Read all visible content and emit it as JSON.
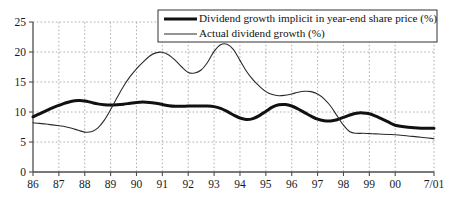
{
  "chart_data": {
    "type": "line",
    "title": "",
    "xlabel": "",
    "ylabel": "",
    "xlim": [
      1986,
      2001.5
    ],
    "ylim": [
      0,
      25
    ],
    "yticks": [
      0,
      5,
      10,
      15,
      20,
      25
    ],
    "ytick_labels": [
      "0",
      "5",
      "10",
      "15",
      "20",
      "25"
    ],
    "xtick_labels": [
      "86",
      "87",
      "88",
      "89",
      "90",
      "91",
      "92",
      "93",
      "94",
      "95",
      "96",
      "97",
      "98",
      "99",
      "00",
      "7/01"
    ],
    "xtick_values": [
      1986,
      1987,
      1988,
      1989,
      1990,
      1991,
      1992,
      1993,
      1994,
      1995,
      1996,
      1997,
      1998,
      1999,
      2000,
      2001.5
    ],
    "grid": true,
    "grid_style": "dotted",
    "legend_position": "top-right",
    "series": [
      {
        "name": "Dividend growth implicit in year-end share price (%)",
        "color": "#111111",
        "width": 3.0,
        "x": [
          1986.0,
          1986.25,
          1986.5,
          1986.75,
          1987.0,
          1987.25,
          1987.5,
          1987.75,
          1988.0,
          1988.25,
          1988.5,
          1988.75,
          1989.0,
          1989.25,
          1989.5,
          1989.75,
          1990.0,
          1990.25,
          1990.5,
          1990.75,
          1991.0,
          1991.25,
          1991.5,
          1991.75,
          1992.0,
          1992.25,
          1992.5,
          1992.75,
          1993.0,
          1993.25,
          1993.5,
          1993.75,
          1994.0,
          1994.25,
          1994.5,
          1994.75,
          1995.0,
          1995.25,
          1995.5,
          1995.75,
          1996.0,
          1996.25,
          1996.5,
          1996.75,
          1997.0,
          1997.25,
          1997.5,
          1997.75,
          1998.0,
          1998.25,
          1998.5,
          1998.75,
          1999.0,
          1999.25,
          1999.5,
          1999.75,
          2000.0,
          2000.5,
          2001.0,
          2001.5
        ],
        "y": [
          9.2,
          9.7,
          10.2,
          10.7,
          11.1,
          11.5,
          11.8,
          11.9,
          11.85,
          11.6,
          11.35,
          11.2,
          11.15,
          11.2,
          11.3,
          11.45,
          11.6,
          11.65,
          11.6,
          11.45,
          11.25,
          11.05,
          10.95,
          10.95,
          11.0,
          11.0,
          11.0,
          11.0,
          10.9,
          10.6,
          10.1,
          9.5,
          9.0,
          8.75,
          8.9,
          9.4,
          10.1,
          10.8,
          11.2,
          11.25,
          11.0,
          10.5,
          9.9,
          9.3,
          8.8,
          8.55,
          8.5,
          8.7,
          9.1,
          9.5,
          9.8,
          9.85,
          9.7,
          9.3,
          8.8,
          8.3,
          7.8,
          7.45,
          7.3,
          7.3
        ],
        "y_keypoints": {
          "1986": 9.2,
          "1988": 11.85,
          "1990": 11.6,
          "1993": 10.9,
          "1994": 9.0,
          "1995": 10.1,
          "1997": 8.8,
          "1998": 9.1,
          "1999": 9.7,
          "2001.5": 7.3
        }
      },
      {
        "name": "Actual dividend growth (%)",
        "color": "#2a2a2a",
        "width": 1.1,
        "x": [
          1986.0,
          1986.25,
          1986.5,
          1986.75,
          1987.0,
          1987.25,
          1987.5,
          1987.75,
          1988.0,
          1988.25,
          1988.5,
          1988.75,
          1989.0,
          1989.25,
          1989.5,
          1989.75,
          1990.0,
          1990.25,
          1990.5,
          1990.75,
          1991.0,
          1991.25,
          1991.5,
          1991.75,
          1992.0,
          1992.25,
          1992.5,
          1992.75,
          1993.0,
          1993.25,
          1993.5,
          1993.75,
          1994.0,
          1994.25,
          1994.5,
          1994.75,
          1995.0,
          1995.25,
          1995.5,
          1995.75,
          1996.0,
          1996.25,
          1996.5,
          1996.75,
          1997.0,
          1997.25,
          1997.5,
          1997.75,
          1998.0,
          1998.25,
          1998.5,
          1998.75,
          1999.0,
          1999.25,
          1999.5,
          1999.75,
          2000.0,
          2000.5,
          2001.0,
          2001.5
        ],
        "y": [
          8.2,
          8.1,
          8.0,
          7.85,
          7.7,
          7.55,
          7.3,
          6.95,
          6.65,
          6.7,
          7.3,
          8.6,
          10.4,
          12.4,
          14.3,
          15.9,
          17.2,
          18.3,
          19.3,
          19.85,
          19.95,
          19.5,
          18.6,
          17.5,
          16.6,
          16.5,
          17.0,
          18.3,
          20.1,
          21.2,
          21.3,
          20.4,
          18.6,
          16.8,
          15.4,
          14.3,
          13.4,
          12.9,
          12.7,
          12.8,
          13.0,
          13.3,
          13.45,
          13.4,
          13.0,
          12.2,
          11.0,
          9.4,
          7.8,
          6.7,
          6.45,
          6.45,
          6.4,
          6.35,
          6.3,
          6.25,
          6.2,
          6.0,
          5.8,
          5.55
        ],
        "y_keypoints": {
          "1986": 8.2,
          "1988": 6.65,
          "1991": 19.95,
          "1992": 16.6,
          "1993": 21.3,
          "1995": 13.4,
          "1996.5": 13.45,
          "1998": 7.8,
          "2001.5": 5.55
        }
      }
    ]
  },
  "legend": {
    "items": [
      {
        "label": "Dividend growth implicit in year-end share price (%)",
        "swatch": "thick-line-swatch"
      },
      {
        "label": "Actual dividend growth (%)",
        "swatch": "thin-line-swatch"
      }
    ]
  },
  "colors": {
    "axis": "#4d4d4d",
    "grid": "#9a9a9a",
    "text": "#111111",
    "series_thick": "#111111",
    "series_thin": "#2a2a2a",
    "background": "#ffffff"
  }
}
